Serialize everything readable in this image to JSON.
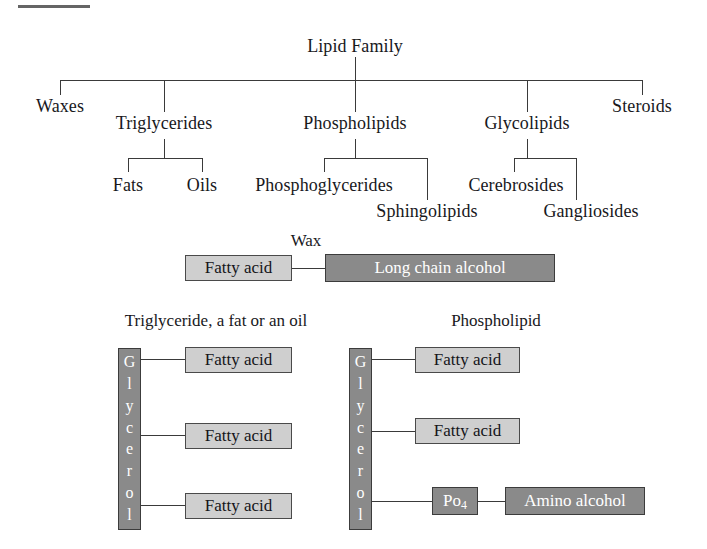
{
  "diagram": {
    "title": "Lipid Family",
    "top_rule": "decorative-rule"
  },
  "tree": {
    "root": "Lipid Family",
    "level1": [
      {
        "label": "Waxes"
      },
      {
        "label": "Triglycerides"
      },
      {
        "label": "Phospholipids"
      },
      {
        "label": "Glycolipids"
      },
      {
        "label": "Steroids"
      }
    ],
    "level2": [
      {
        "parent": "Triglycerides",
        "label": "Fats"
      },
      {
        "parent": "Triglycerides",
        "label": "Oils"
      },
      {
        "parent": "Phospholipids",
        "label": "Phosphoglycerides"
      },
      {
        "parent": "Phospholipids",
        "label": "Sphingolipids"
      },
      {
        "parent": "Glycolipids",
        "label": "Cerebrosides"
      },
      {
        "parent": "Glycolipids",
        "label": "Gangliosides"
      }
    ]
  },
  "structures": {
    "wax": {
      "title": "Wax",
      "left_box": "Fatty acid",
      "right_box": "Long chain alcohol"
    },
    "triglyceride": {
      "title": "Triglyceride, a fat or an oil",
      "backbone": "Glycerol",
      "backbone_letters": [
        "G",
        "l",
        "y",
        "c",
        "e",
        "r",
        "o",
        "l"
      ],
      "arms": [
        "Fatty acid",
        "Fatty acid",
        "Fatty acid"
      ]
    },
    "phospholipid": {
      "title": "Phospholipid",
      "backbone": "Glycerol",
      "backbone_letters": [
        "G",
        "l",
        "y",
        "c",
        "e",
        "r",
        "o",
        "l"
      ],
      "arms": [
        "Fatty acid",
        "Fatty acid"
      ],
      "phosphate": "Po",
      "phosphate_sub": "4",
      "head": "Amino alcohol"
    }
  },
  "colors": {
    "light_box": "#cfcfcf",
    "dark_box": "#8a8a8a",
    "line": "#3a3a3a",
    "text": "#18181c",
    "inverse_text": "#ffffff"
  }
}
